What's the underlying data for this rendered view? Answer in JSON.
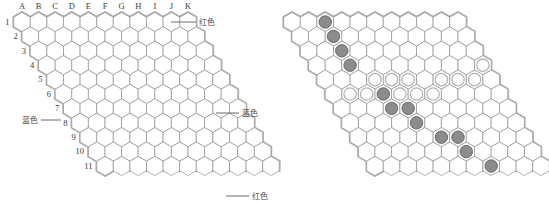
{
  "figure": {
    "panels": [
      {
        "id": "left",
        "name": "empty-board-with-coordinates"
      },
      {
        "id": "right",
        "name": "board-with-stones"
      }
    ]
  },
  "board": {
    "size": 11,
    "columns": [
      "A",
      "B",
      "C",
      "D",
      "E",
      "F",
      "G",
      "H",
      "I",
      "J",
      "K"
    ],
    "rows": [
      "1",
      "2",
      "3",
      "4",
      "5",
      "6",
      "7",
      "8",
      "9",
      "10",
      "11"
    ]
  },
  "edge_labels": {
    "top": "红色",
    "bottom": "红色",
    "left": "蓝色",
    "right": "蓝色"
  },
  "colors": {
    "red_edge": "#b0b0b0",
    "blue_edge": "#b8b8b8",
    "cell_stroke": "#8f8f8f",
    "dark_stone_fill": "#8c8c8c",
    "dark_stone_stroke": "#6a6a6a",
    "light_stone_fill": "#ffffff",
    "light_stone_stroke": "#b4b4b4",
    "label_text": "#3a3a3a",
    "leader_line": "#5a5a5a",
    "background": "#ffffff"
  },
  "stones": {
    "dark": [
      "C1",
      "C2",
      "C3",
      "C4",
      "E6",
      "E7",
      "F7",
      "F8",
      "G9",
      "H9",
      "H10",
      "I11"
    ],
    "light": [
      "D5",
      "E5",
      "F5",
      "B6",
      "C6",
      "D6",
      "G6",
      "H6",
      "I6",
      "F5b",
      "G5",
      "H5",
      "I5",
      "J5"
    ]
  },
  "stone_cells": {
    "dark": [
      {
        "col": 2,
        "row": 0
      },
      {
        "col": 2,
        "row": 1
      },
      {
        "col": 2,
        "row": 2
      },
      {
        "col": 2,
        "row": 3
      },
      {
        "col": 3,
        "row": 5
      },
      {
        "col": 3,
        "row": 6
      },
      {
        "col": 4,
        "row": 6
      },
      {
        "col": 4,
        "row": 7
      },
      {
        "col": 5,
        "row": 8
      },
      {
        "col": 6,
        "row": 8
      },
      {
        "col": 6,
        "row": 9
      },
      {
        "col": 7,
        "row": 10
      }
    ],
    "light": [
      {
        "col": 3,
        "row": 4
      },
      {
        "col": 4,
        "row": 4
      },
      {
        "col": 5,
        "row": 4
      },
      {
        "col": 7,
        "row": 4
      },
      {
        "col": 8,
        "row": 4
      },
      {
        "col": 9,
        "row": 4
      },
      {
        "col": 10,
        "row": 3
      },
      {
        "col": 1,
        "row": 5
      },
      {
        "col": 2,
        "row": 5
      },
      {
        "col": 4,
        "row": 5
      },
      {
        "col": 5,
        "row": 5
      },
      {
        "col": 6,
        "row": 5
      }
    ]
  },
  "geometry": {
    "left_origin_x": 22,
    "right_origin_x": 292,
    "origin_y": 22,
    "hex_radius": 9.6,
    "col_step_x": 16.6,
    "row_step_x": 8.3,
    "row_step_y": 14.4,
    "stone_radius": 6.2
  },
  "leaders": {
    "top_right": {
      "x1": 171,
      "y1": 22,
      "x2": 196,
      "y2": 22,
      "label_x": 199,
      "label_y": 25
    },
    "bottom_right": {
      "x1": 236,
      "y1": 196,
      "x2": 261,
      "y2": 196,
      "label_x": 228,
      "label_y": 199
    },
    "left_middle": {
      "x1": 44,
      "y1": 120,
      "x2": 62,
      "y2": 120,
      "label_x": 12,
      "label_y": 123
    },
    "right_middle": {
      "x1": 236,
      "y1": 112,
      "x2": 258,
      "y2": 112,
      "label_x": 231,
      "label_y": 115
    }
  }
}
